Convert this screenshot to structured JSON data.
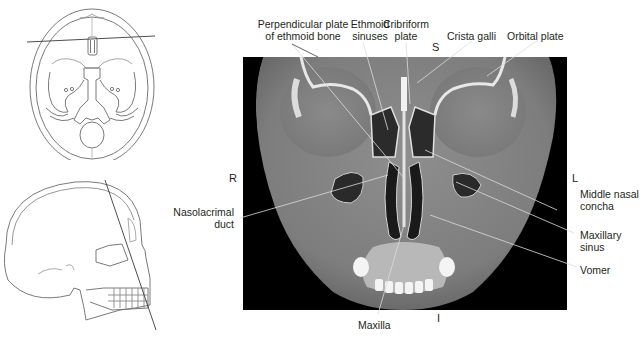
{
  "figure": {
    "type": "coronal CT of paranasal sinuses with orientation diagrams",
    "orientation": {
      "superior": "S",
      "inferior": "I",
      "right": "R",
      "left": "L"
    },
    "labels": [
      {
        "id": "perpendicular-plate",
        "lines": [
          "Perpendicular plate",
          "of ethmoid bone"
        ]
      },
      {
        "id": "ethmoid-sinuses",
        "lines": [
          "Ethmoid",
          "sinuses"
        ]
      },
      {
        "id": "cribriform-plate",
        "lines": [
          "Cribriform",
          "plate"
        ]
      },
      {
        "id": "crista-galli",
        "lines": [
          "Crista galli"
        ]
      },
      {
        "id": "orbital-plate",
        "lines": [
          "Orbital plate"
        ]
      },
      {
        "id": "nasolacrimal-duct",
        "lines": [
          "Nasolacrimal",
          "duct"
        ]
      },
      {
        "id": "middle-nasal-concha",
        "lines": [
          "Middle nasal",
          "concha"
        ]
      },
      {
        "id": "maxillary-sinus",
        "lines": [
          "Maxillary",
          "sinus"
        ]
      },
      {
        "id": "vomer",
        "lines": [
          "Vomer"
        ]
      },
      {
        "id": "maxilla",
        "lines": [
          "Maxilla"
        ]
      }
    ],
    "thumbnails": [
      {
        "id": "axial-skull-base",
        "view": "axial (skull base) with scan line"
      },
      {
        "id": "sagittal-skull",
        "view": "lateral skull with oblique scan line"
      }
    ]
  }
}
